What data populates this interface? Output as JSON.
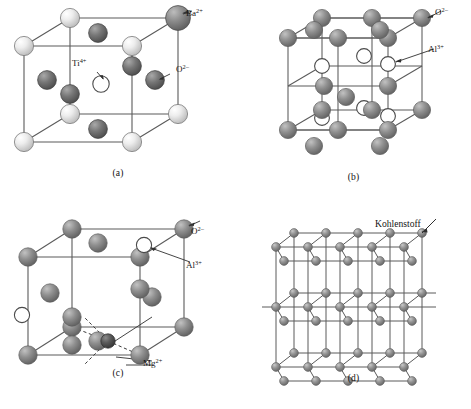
{
  "figure": {
    "background_color": "#ffffff",
    "kind": "ceramic-crystal-structure-plate",
    "top_artifact_text": "· ·  ··   · ··  ·"
  },
  "colors": {
    "line": "#5b5b5b",
    "sphere_light": "#e8e8e8",
    "sphere_light_edge": "#7a7a7a",
    "sphere_mid": "#9a9a9a",
    "sphere_mid_edge": "#5e5e5e",
    "sphere_dark": "#6f6f6f",
    "sphere_dark_edge": "#3f3f3f",
    "sphere_open_fill": "#ffffff",
    "sphere_open_edge": "#4a4a4a",
    "label_text": "#151515",
    "leader_line": "#303030"
  },
  "panels": [
    {
      "id": "a",
      "caption": "(a)",
      "compound": "BaTiO3 perovskite unit cell",
      "labels": [
        {
          "name": "ba-label",
          "base": "Ba",
          "sup": "2+",
          "x": 186,
          "y": 16
        },
        {
          "name": "ti-label",
          "base": "Ti",
          "sup": "4+",
          "x": 72,
          "y": 66
        },
        {
          "name": "o-label",
          "base": "O",
          "sup": "2–",
          "x": 176,
          "y": 72
        }
      ],
      "species": [
        {
          "symbol": "Ba",
          "charge": "2+",
          "shade": "light",
          "role": "corner"
        },
        {
          "symbol": "Ti",
          "charge": "4+",
          "shade": "open",
          "role": "body-center"
        },
        {
          "symbol": "O",
          "charge": "2–",
          "shade": "dark",
          "role": "face-center"
        }
      ]
    },
    {
      "id": "b",
      "caption": "(b)",
      "compound": "Al2O3 corundum cell",
      "labels": [
        {
          "name": "o-label",
          "base": "O",
          "sup": "2–",
          "x": 199,
          "y": 15
        },
        {
          "name": "al-label",
          "base": "Al",
          "sup": "3+",
          "x": 192,
          "y": 52
        }
      ],
      "species": [
        {
          "symbol": "O",
          "charge": "2–",
          "shade": "mid",
          "role": "layer-sphere"
        },
        {
          "symbol": "Al",
          "charge": "3+",
          "shade": "open",
          "role": "interstitial"
        }
      ]
    },
    {
      "id": "c",
      "caption": "(c)",
      "compound": "MgAl2O4 spinel cell",
      "labels": [
        {
          "name": "o-label",
          "base": "O",
          "sup": "2–",
          "x": 191,
          "y": 29
        },
        {
          "name": "al-label",
          "base": "Al",
          "sup": "3+",
          "x": 186,
          "y": 63
        },
        {
          "name": "mg-label",
          "base": "Mg",
          "sup": "2+",
          "x": 143,
          "y": 161
        }
      ],
      "species": [
        {
          "symbol": "O",
          "charge": "2–",
          "shade": "mid",
          "role": "fcc-sphere"
        },
        {
          "symbol": "Al",
          "charge": "3+",
          "shade": "open",
          "role": "octahedral"
        },
        {
          "symbol": "Mg",
          "charge": "2+",
          "shade": "dark",
          "role": "tetrahedral"
        }
      ]
    },
    {
      "id": "d",
      "caption": "(d)",
      "compound": "graphite layered structure",
      "labels": [
        {
          "name": "carbon-label",
          "text": "Kohlenstoff",
          "x": 139,
          "y": 22
        }
      ],
      "species": [
        {
          "symbol": "C",
          "charge": "",
          "shade": "mid",
          "role": "graphite-node"
        }
      ]
    }
  ]
}
